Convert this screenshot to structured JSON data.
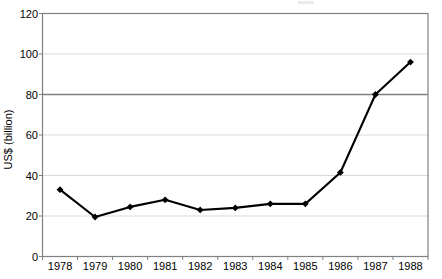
{
  "chart_data": {
    "type": "line",
    "title": "",
    "xlabel": "",
    "ylabel": "US$ (billion)",
    "categories": [
      "1978",
      "1979",
      "1980",
      "1981",
      "1982",
      "1983",
      "1984",
      "1985",
      "1986",
      "1987",
      "1988"
    ],
    "values": [
      33,
      19.5,
      24.5,
      28,
      23,
      24,
      26,
      26,
      41.5,
      80,
      96
    ],
    "series": [
      {
        "name": "US$ (billion)",
        "values": [
          33,
          19.5,
          24.5,
          28,
          23,
          24,
          26,
          26,
          41.5,
          80,
          96
        ]
      }
    ],
    "ylim": [
      0,
      120
    ],
    "yticks": [
      0,
      20,
      40,
      60,
      80,
      100,
      120
    ],
    "ytick_labels": [
      "0",
      "20",
      "40",
      "60",
      "80",
      "100",
      "120"
    ],
    "grid": true,
    "grid_axis": "y",
    "legend": false,
    "legend_position": "none",
    "marker": "diamond",
    "line_color": "#000000",
    "marker_color": "#000000",
    "grid_color": "#d9d9d9",
    "emphasis_gridline_value": 80,
    "emphasis_gridline_color": "#808080",
    "axis_color": "#808080",
    "plot_background": "#ffffff"
  },
  "axes": {
    "y_title": "US$ (billion)"
  }
}
